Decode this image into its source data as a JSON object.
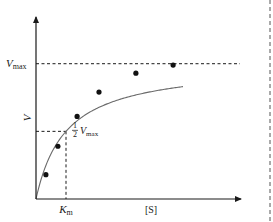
{
  "chart_data": {
    "type": "line",
    "title": "",
    "xlabel": "[S]",
    "ylabel": "V",
    "xlim": [
      0,
      6.9
    ],
    "ylim": [
      0,
      1.36
    ],
    "grid": false,
    "legend": null,
    "reference_lines": {
      "vmax": {
        "value": 1.0,
        "label_main": "V",
        "label_sub": "max"
      },
      "half_vmax": {
        "value": 0.5,
        "label_frac": "1/2",
        "label_num": "1",
        "label_den": "2",
        "label_main": "V",
        "label_sub": "max"
      },
      "km": {
        "value": 1.0,
        "label_main": "K",
        "label_sub": "m"
      }
    },
    "curve": {
      "model": "michaelis-menten",
      "vmax": 1.0,
      "km": 1.0,
      "x_range": [
        0,
        4.9
      ]
    },
    "series": [
      {
        "name": "measured rates",
        "x": [
          0.33,
          0.73,
          1.37,
          2.1,
          3.33,
          4.57
        ],
        "values": [
          0.18,
          0.39,
          0.61,
          0.79,
          0.93,
          0.99
        ]
      }
    ]
  }
}
